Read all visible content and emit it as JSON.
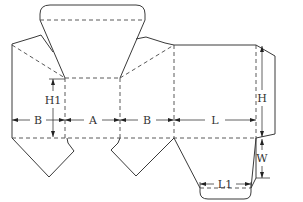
{
  "diagram": {
    "type": "box dieline (folding carton template)",
    "colors": {
      "line": "#3a3a3a",
      "background": "#ffffff"
    },
    "line_types": [
      "cut line (solid)",
      "fold line (dashed)"
    ],
    "panels": [
      "B",
      "A",
      "B",
      "L"
    ],
    "labels": {
      "b_left": "B",
      "a": "A",
      "b_right": "B",
      "l": "L",
      "h1": "H1",
      "h": "H",
      "w": "W",
      "l1": "L1"
    }
  }
}
